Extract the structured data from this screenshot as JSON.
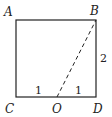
{
  "figure": {
    "type": "geometry",
    "shape": "square",
    "vertices": {
      "A": {
        "label": "A",
        "x": 16,
        "y": 20
      },
      "B": {
        "label": "B",
        "x": 96,
        "y": 20
      },
      "C": {
        "label": "C",
        "x": 16,
        "y": 97
      },
      "D": {
        "label": "D",
        "x": 96,
        "y": 97
      },
      "O": {
        "label": "O",
        "x": 57,
        "y": 97
      }
    },
    "segments": [
      {
        "from": "A",
        "to": "B",
        "style": "solid"
      },
      {
        "from": "B",
        "to": "D",
        "style": "solid"
      },
      {
        "from": "D",
        "to": "C",
        "style": "solid"
      },
      {
        "from": "C",
        "to": "A",
        "style": "solid"
      },
      {
        "from": "O",
        "to": "B",
        "style": "dashed"
      }
    ],
    "measure_labels": {
      "BD": "2",
      "CO": "1",
      "OD": "1"
    },
    "colors": {
      "stroke": "#222222",
      "background": "#ffffff"
    }
  }
}
